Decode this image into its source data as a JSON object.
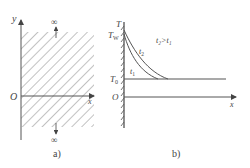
{
  "panel_a": {
    "caption": "a)",
    "y_axis_label": "y",
    "x_axis_label": "x",
    "origin_label": "O",
    "top_infinity": "∞",
    "bottom_infinity": "∞"
  },
  "panel_b": {
    "caption": "b)",
    "y_axis_label": "T",
    "wall_temp_label": "T",
    "wall_temp_sub": "W",
    "initial_temp_label": "T",
    "initial_temp_sub": "0",
    "origin_label": "O",
    "x_axis_label": "x",
    "curve_t1_label": "t",
    "curve_t1_sub": "1",
    "curve_t2_label": "t",
    "curve_t2_sub": "2",
    "relation_text": "t₂>t₁"
  }
}
